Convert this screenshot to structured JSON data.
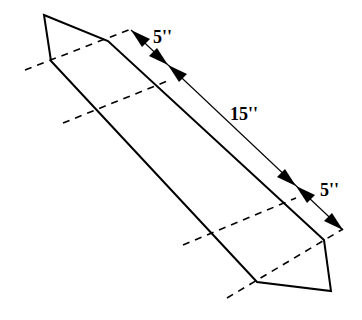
{
  "figure": {
    "type": "board-cut-diagram",
    "colors": {
      "stroke": "#000000",
      "background": "#ffffff"
    }
  },
  "dimensions": [
    {
      "id": "top-end",
      "label": "5''",
      "value": 5,
      "unit": "in"
    },
    {
      "id": "middle",
      "label": "15''",
      "value": 15,
      "unit": "in"
    },
    {
      "id": "bottom-end",
      "label": "5''",
      "value": 5,
      "unit": "in"
    }
  ],
  "labels": {
    "top_dim": "5''",
    "mid_dim": "15''",
    "bottom_dim": "5''"
  },
  "dashed_lines_count": 4
}
